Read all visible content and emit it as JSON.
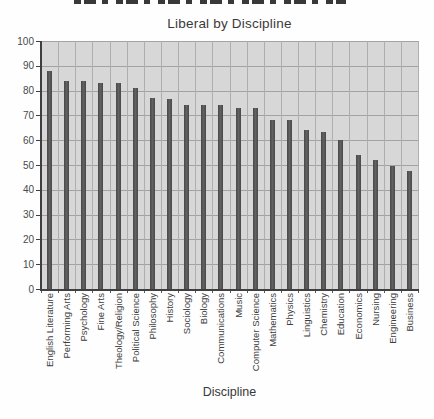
{
  "chart_data": {
    "type": "bar",
    "title": "Liberal by Discipline",
    "xlabel": "Discipline",
    "ylabel": "",
    "ylim": [
      0,
      100
    ],
    "yticks": [
      0,
      10,
      20,
      30,
      40,
      50,
      60,
      70,
      80,
      90,
      100
    ],
    "grid": "full-grid-horizontal-and-vertical",
    "legend": "none",
    "bar_color": "#515151",
    "plot_background": "#d7d7d7",
    "gridline_color": "#a8a8a8",
    "categories": [
      "English Literature",
      "Performing Arts",
      "Psychology",
      "Fine Arts",
      "Theology/Religion",
      "Political Science",
      "Philosophy",
      "History",
      "Sociology",
      "Biology",
      "Communications",
      "Music",
      "Computer Science",
      "Mathematics",
      "Physics",
      "Linguistics",
      "Chemistry",
      "Education",
      "Economics",
      "Nursing",
      "Engineering",
      "Business"
    ],
    "values": [
      88,
      84,
      84,
      83,
      83,
      81,
      77,
      76.5,
      74,
      74,
      74,
      73,
      73,
      68,
      68,
      64,
      63.5,
      60,
      54,
      52,
      49.5,
      47.5
    ]
  }
}
